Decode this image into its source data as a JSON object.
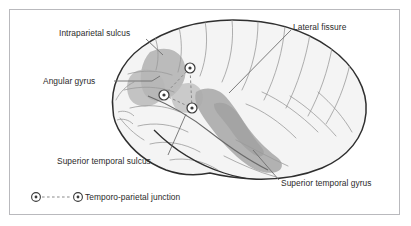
{
  "figure": {
    "kind": "anatomical-illustration",
    "background_color": "#ffffff",
    "frame_color": "#b9b9bd"
  },
  "labels": {
    "intraparietal_sulcus": "Intraparietal sulcus",
    "angular_gyrus": "Angular gyrus",
    "superior_temporal_sulcus": "Superior temporal sulcus",
    "lateral_fissure": "Lateral fissure",
    "superior_temporal_gyrus": "Superior temporal gyrus"
  },
  "legend": {
    "marker_icon": "circled-dot-marker",
    "connector_icon": "dashed-line",
    "text": "Temporo-parietal junction"
  },
  "colors": {
    "outline": "#2f2f2f",
    "cortex_fill": "#f4f4f4",
    "sulci_lines": "#9a9a9a",
    "shaded_region": "#b3b3b3",
    "shaded_region_dark": "#a2a2a2",
    "marker_stroke": "#3a3a3a",
    "leader_line": "#6e6e6e",
    "dashed_connector": "#8a8a8a",
    "text": "#2b2b2b"
  },
  "markers": [
    {
      "name": "tpj-marker-superior",
      "x": 190,
      "y": 68
    },
    {
      "name": "tpj-marker-anterior",
      "x": 164,
      "y": 95
    },
    {
      "name": "tpj-marker-inferior",
      "x": 192,
      "y": 108
    }
  ]
}
